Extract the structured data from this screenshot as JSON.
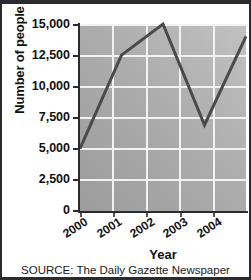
{
  "chart_data": {
    "type": "line",
    "title": "",
    "xlabel": "Year",
    "ylabel": "Number of people",
    "categories": [
      "2000",
      "2001",
      "2002",
      "2003",
      "2004"
    ],
    "x": [
      2000,
      2001,
      2002,
      2003,
      2004
    ],
    "values": [
      5000,
      12500,
      15000,
      6900,
      14000
    ],
    "series": [
      {
        "name": "Number of people",
        "values": [
          5000,
          12500,
          15000,
          6900,
          14000
        ]
      }
    ],
    "ylim": [
      0,
      15000
    ],
    "ytick_values": [
      15000,
      12500,
      10000,
      7500,
      5000,
      2500,
      0
    ],
    "ytick_labels": [
      "15,000",
      "12,500",
      "10,000",
      "7,500",
      "5,000",
      "2,500",
      "0"
    ],
    "xtick_labels": [
      "2000",
      "2001",
      "2002",
      "2003",
      "2004"
    ],
    "grid": true,
    "legend": "none",
    "line_color": "#4a4a4a",
    "plot_background": "gray-gradient",
    "gridline_color": "#f2f2f2"
  },
  "source": {
    "text": "SOURCE: The Daily Gazette Newspaper"
  }
}
